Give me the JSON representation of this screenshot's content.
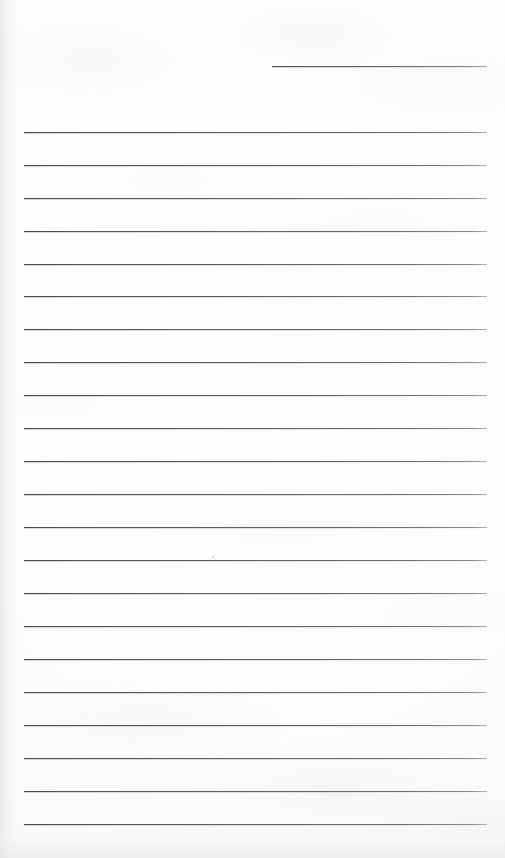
{
  "document": {
    "kind": "scanned-ruled-notebook-page",
    "title": "Blank ruled page",
    "page_width": 505,
    "page_height": 858,
    "content_text": "",
    "is_blank": true,
    "paper_color": "#fdfdfd",
    "rule_color": "#636366",
    "rule_thickness_px": 1
  },
  "layout": {
    "rule_left_x": 24,
    "rule_right_x": 487,
    "rule_width": 463,
    "first_full_rule_y": 132,
    "rule_spacing_px": 32.95,
    "full_rule_count": 22,
    "header_rule": {
      "label": "header-rule",
      "left_x": 272,
      "right_x": 487,
      "width": 215,
      "y": 66
    }
  },
  "rules": [
    {
      "index": 1,
      "y": 132,
      "x": 24,
      "width": 463
    },
    {
      "index": 2,
      "y": 165,
      "x": 24,
      "width": 463
    },
    {
      "index": 3,
      "y": 198,
      "x": 24,
      "width": 463
    },
    {
      "index": 4,
      "y": 231,
      "x": 24,
      "width": 463
    },
    {
      "index": 5,
      "y": 264,
      "x": 24,
      "width": 463
    },
    {
      "index": 6,
      "y": 296,
      "x": 24,
      "width": 463
    },
    {
      "index": 7,
      "y": 329,
      "x": 24,
      "width": 463
    },
    {
      "index": 8,
      "y": 362,
      "x": 24,
      "width": 463
    },
    {
      "index": 9,
      "y": 395,
      "x": 24,
      "width": 463
    },
    {
      "index": 10,
      "y": 428,
      "x": 24,
      "width": 463
    },
    {
      "index": 11,
      "y": 461,
      "x": 24,
      "width": 463
    },
    {
      "index": 12,
      "y": 494,
      "x": 24,
      "width": 463
    },
    {
      "index": 13,
      "y": 527,
      "x": 24,
      "width": 463
    },
    {
      "index": 14,
      "y": 560,
      "x": 24,
      "width": 463
    },
    {
      "index": 15,
      "y": 593,
      "x": 24,
      "width": 463
    },
    {
      "index": 16,
      "y": 626,
      "x": 24,
      "width": 463
    },
    {
      "index": 17,
      "y": 659,
      "x": 24,
      "width": 463
    },
    {
      "index": 18,
      "y": 692,
      "x": 24,
      "width": 463
    },
    {
      "index": 19,
      "y": 725,
      "x": 24,
      "width": 463
    },
    {
      "index": 20,
      "y": 758,
      "x": 24,
      "width": 463
    },
    {
      "index": 21,
      "y": 791,
      "x": 24,
      "width": 463
    },
    {
      "index": 22,
      "y": 824,
      "x": 24,
      "width": 463
    }
  ],
  "artifacts": {
    "specks": [
      {
        "x": 212,
        "y": 556,
        "size": 2
      },
      {
        "x": 131,
        "y": 563,
        "size": 1
      },
      {
        "x": 379,
        "y": 298,
        "size": 1
      }
    ]
  }
}
